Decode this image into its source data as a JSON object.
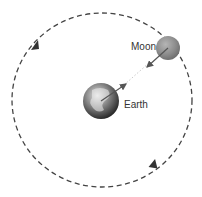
{
  "diagram": {
    "type": "orbit",
    "labels": {
      "moon": "Moon",
      "earth": "Earth"
    },
    "orbit": {
      "cx": 102,
      "cy": 100,
      "rx": 90,
      "ry": 87,
      "direction": "counterclockwise",
      "style": "dashed"
    },
    "moon": {
      "cx": 168,
      "cy": 48,
      "r": 12,
      "color": "#8a8a8a"
    },
    "earth": {
      "cx": 101,
      "cy": 101,
      "r": 18
    },
    "arrows": [
      {
        "from": "earth",
        "to": "moon",
        "description": "force on Moon toward Earth / Earth toward Moon"
      }
    ],
    "colors": {
      "orbit": "#444444",
      "arrow": "#666666"
    }
  }
}
